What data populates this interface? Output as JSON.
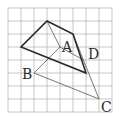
{
  "grid": {
    "origin": [
      8,
      8
    ],
    "cell": 13,
    "cols": 8,
    "rows": 8,
    "color": "#b8b8b8"
  },
  "points": {
    "P_top": [
      3,
      1
    ],
    "P_left": [
      1,
      3
    ],
    "P_upright": [
      5,
      2
    ],
    "P_botright": [
      6,
      5
    ],
    "A": [
      4,
      3
    ],
    "B": [
      2,
      5
    ],
    "C": [
      7,
      7
    ],
    "D": [
      5.8,
      4
    ]
  },
  "labels": {
    "A": "A",
    "B": "B",
    "C": "C",
    "D": "D"
  },
  "colors": {
    "thick": "#2a2a2a",
    "thin": "#555555"
  }
}
